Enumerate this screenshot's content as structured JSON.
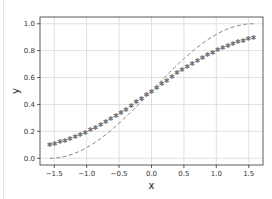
{
  "chart_data": {
    "type": "line",
    "title": "",
    "xlabel": "x",
    "ylabel": "y",
    "xlim": [
      -1.72,
      1.72
    ],
    "ylim": [
      -0.05,
      1.05
    ],
    "grid": true,
    "legend": null,
    "xticks": [
      "−1.5",
      "−1.0",
      "−0.5",
      "0.0",
      "0.5",
      "1.0",
      "1.5"
    ],
    "xtick_values": [
      -1.5,
      -1.0,
      -0.5,
      0.0,
      0.5,
      1.0,
      1.5
    ],
    "yticks": [
      "0.0",
      "0.2",
      "0.4",
      "0.6",
      "0.8",
      "1.0"
    ],
    "ytick_values": [
      0.0,
      0.2,
      0.4,
      0.6,
      0.8,
      1.0
    ],
    "series": [
      {
        "name": "dashed curve",
        "style": "dashed",
        "color": "#888888",
        "x": [
          -1.571,
          -1.2,
          -0.8,
          -0.4,
          0.0,
          0.4,
          0.8,
          1.2,
          1.571
        ],
        "values": [
          0.0,
          0.03,
          0.14,
          0.31,
          0.5,
          0.69,
          0.86,
          0.97,
          1.0
        ]
      },
      {
        "name": "star markers",
        "style": "markers",
        "marker": "*",
        "color": "#777777",
        "x": [
          -1.571,
          -1.2,
          -0.8,
          -0.4,
          0.0,
          0.4,
          0.8,
          1.2,
          1.571
        ],
        "values": [
          0.1,
          0.16,
          0.25,
          0.36,
          0.5,
          0.64,
          0.75,
          0.84,
          0.9
        ]
      }
    ]
  }
}
